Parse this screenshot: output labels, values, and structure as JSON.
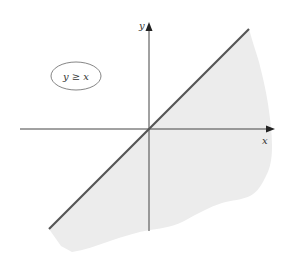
{
  "figure": {
    "type": "inequality-region-graph",
    "inequality_label": "y ≥ x",
    "boundary_line": "y = x",
    "boundary_style": "solid",
    "shaded_region": "right/below of boundary line",
    "axes": {
      "x_label": "x",
      "y_label": "y"
    },
    "colors": {
      "background": "#ffffff",
      "shading": "#ececec",
      "boundary_line": "#555555",
      "axes": "#444444",
      "label_ellipse": "#666666",
      "text": "#333333"
    }
  }
}
